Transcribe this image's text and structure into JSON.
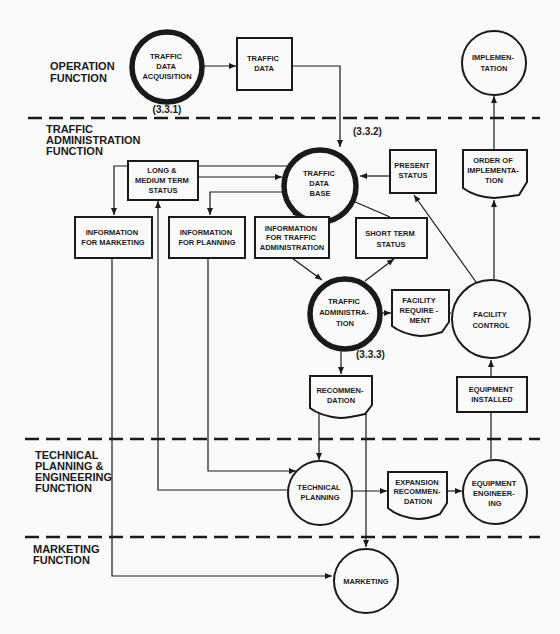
{
  "sections": {
    "operation": [
      "OPERATION",
      "FUNCTION"
    ],
    "traffic_admin": [
      "TRAFFIC",
      "ADMINISTRATION",
      "FUNCTION"
    ],
    "technical": [
      "TECHNICAL",
      "PLANNING &",
      "ENGINEERING",
      "FUNCTION"
    ],
    "marketing": [
      "MARKETING",
      "FUNCTION"
    ]
  },
  "refs": {
    "acquisition": "(3.3.1)",
    "database": "(3.3.2)",
    "administration": "(3.3.3)"
  },
  "nodes": {
    "traffic_data_acquisition": [
      "TRAFFIC",
      "DATA",
      "ACQUISITION"
    ],
    "traffic_data": [
      "TRAFFIC",
      "DATA"
    ],
    "implementation": [
      "IMPLEMEN-",
      "TATION"
    ],
    "traffic_data_base": [
      "TRAFFIC",
      "DATA",
      "BASE"
    ],
    "present_status": [
      "PRESENT",
      "STATUS"
    ],
    "order_of_implementation": [
      "ORDER OF",
      "IMPLEMENTA-",
      "TION"
    ],
    "long_medium_term_status": [
      "LONG &",
      "MEDIUM TERM",
      "STATUS"
    ],
    "information_for_marketing": [
      "INFORMATION",
      "FOR MARKETING"
    ],
    "information_for_planning": [
      "INFORMATION",
      "FOR PLANNING"
    ],
    "information_for_traffic_administration": [
      "INFORMATION",
      "FOR TRAFFIC",
      "ADMINISTRATION"
    ],
    "short_term_status": [
      "SHORT TERM",
      "STATUS"
    ],
    "traffic_administration": [
      "TRAFFIC",
      "ADMINISTRA-",
      "TION"
    ],
    "facility_requirement": [
      "FACILITY",
      "REQUIRE -",
      "MENT"
    ],
    "facility_control": [
      "FACILITY",
      "CONTROL"
    ],
    "recommendation": [
      "RECOMMEN-",
      "DATION"
    ],
    "equipment_installed": [
      "EQUIPMENT",
      "INSTALLED"
    ],
    "technical_planning": [
      "TECHNICAL",
      "PLANNING"
    ],
    "expansion_recommendation": [
      "EXPANSION",
      "RECOMMEN-",
      "DATION"
    ],
    "equipment_engineering": [
      "EQUIPMENT",
      "ENGINEER-",
      "ING"
    ],
    "marketing": [
      "MARKETING"
    ]
  },
  "colors": {
    "ink": "#1a1a1a",
    "paper": "#fafafa"
  }
}
